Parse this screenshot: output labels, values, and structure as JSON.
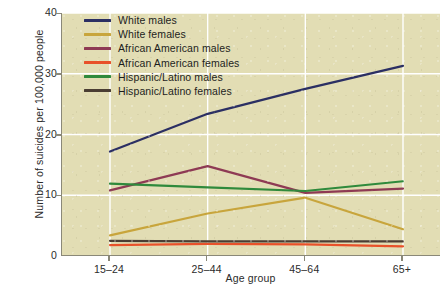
{
  "chart_data": {
    "type": "line",
    "title": "",
    "xlabel": "Age group",
    "ylabel": "Number of suicides per 100,000 people",
    "categories": [
      "15–24",
      "25–44",
      "45–64",
      "65+"
    ],
    "ylim": [
      0,
      40
    ],
    "yticks": [
      0,
      10,
      20,
      30,
      40
    ],
    "grid": true,
    "legend_position": "top-left-inside",
    "series": [
      {
        "name": "White males",
        "color": "#2b2f63",
        "values": [
          17.2,
          23.4,
          27.5,
          31.3
        ]
      },
      {
        "name": "White females",
        "color": "#c8a53c",
        "values": [
          3.4,
          7.0,
          9.6,
          4.4
        ]
      },
      {
        "name": "African American males",
        "color": "#8e3a54",
        "values": [
          10.8,
          14.8,
          10.4,
          11.1
        ]
      },
      {
        "name": "African American females",
        "color": "#e8512a",
        "values": [
          1.8,
          2.0,
          1.9,
          1.6
        ]
      },
      {
        "name": "Hispanic/Latino males",
        "color": "#2f8a3c",
        "values": [
          11.9,
          11.3,
          10.7,
          12.3
        ]
      },
      {
        "name": "Hispanic/Latino females",
        "color": "#4a3d33",
        "values": [
          2.5,
          2.4,
          2.4,
          2.4
        ]
      }
    ]
  },
  "colors": {
    "plot_background": "#e2ddb4",
    "page_background": "#ffffff",
    "axis": "#8a8878",
    "gridline": "#ffffff",
    "text": "#2b2b2b"
  }
}
